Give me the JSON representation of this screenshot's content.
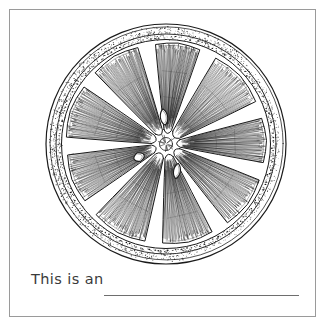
{
  "page": {
    "background_color": "#ffffff",
    "width": 329,
    "height": 327
  },
  "worksheet": {
    "frame": {
      "border_color": "#9a9a9a",
      "fill_color": "#ffffff"
    },
    "illustration": {
      "name": "orange-citrus-cross-section",
      "description": "Black ink line drawing of a halved orange showing radiating segments, juice vesicles, pips and a stippled rind",
      "style": "pen-and-ink line art",
      "line_color": "#1a1a1a",
      "fill_color": "#ffffff",
      "segment_count": 9,
      "seed_count": 3,
      "center_x": 156,
      "center_y": 134,
      "outer_radius": 120,
      "rind_inner_radius": 110,
      "pith_radius": 104
    },
    "prompt": {
      "label": "This is an",
      "answer_value": "",
      "answer_placeholder": "",
      "line_color": "#6e6e6e"
    }
  }
}
